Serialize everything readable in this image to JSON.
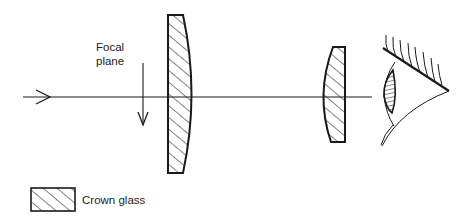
{
  "diagram": {
    "type": "optical eyepiece (Huygens) schematic",
    "labels": {
      "focal_line1": "Focal",
      "focal_line2": "plane",
      "legend": "Crown glass"
    },
    "elements": [
      {
        "id": "optical-axis",
        "kind": "line",
        "description": "Incoming light ray along optical axis, arrow pointing right"
      },
      {
        "id": "focal-plane-arrow",
        "kind": "arrow",
        "description": "Vertical arrow pointing down marking focal plane"
      },
      {
        "id": "field-lens",
        "kind": "lens",
        "shape": "plano-convex, flat side facing incoming light",
        "material": "Crown glass"
      },
      {
        "id": "eye-lens",
        "kind": "lens",
        "shape": "plano-convex, flat side facing eye",
        "material": "Crown glass"
      },
      {
        "id": "eye",
        "kind": "illustration",
        "description": "Observer's eye with eyelashes"
      }
    ],
    "colors": {
      "stroke": "#1a1a1a",
      "background": "#ffffff"
    }
  }
}
